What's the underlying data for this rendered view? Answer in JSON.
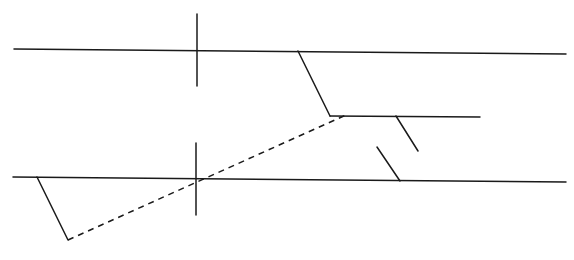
{
  "diagram": {
    "stroke_color": "#1a1a1a",
    "background": "#ffffff",
    "segments": [
      {
        "id": "upper-horizontal-line",
        "style": "solid",
        "x1": 14,
        "y1": 49,
        "x2": 566,
        "y2": 54
      },
      {
        "id": "upper-vertical-tick",
        "style": "solid",
        "x1": 197,
        "y1": 14,
        "x2": 197,
        "y2": 86
      },
      {
        "id": "upper-offset-slope",
        "style": "solid",
        "x1": 298,
        "y1": 51,
        "x2": 330,
        "y2": 116
      },
      {
        "id": "middle-horizontal-line",
        "style": "solid",
        "x1": 330,
        "y1": 116,
        "x2": 480,
        "y2": 117
      },
      {
        "id": "middle-short-tick",
        "style": "solid",
        "x1": 396,
        "y1": 116,
        "x2": 418,
        "y2": 151
      },
      {
        "id": "lower-short-tick",
        "style": "solid",
        "x1": 377,
        "y1": 147,
        "x2": 400,
        "y2": 181
      },
      {
        "id": "lower-horizontal-line",
        "style": "solid",
        "x1": 13,
        "y1": 177,
        "x2": 566,
        "y2": 182
      },
      {
        "id": "lower-vertical-tick",
        "style": "solid",
        "x1": 196,
        "y1": 143,
        "x2": 196,
        "y2": 215
      },
      {
        "id": "lower-offset-slope",
        "style": "solid",
        "x1": 37,
        "y1": 177,
        "x2": 68,
        "y2": 240
      },
      {
        "id": "dashed-connector",
        "style": "dashed",
        "x1": 68,
        "y1": 240,
        "x2": 346,
        "y2": 115
      }
    ]
  }
}
